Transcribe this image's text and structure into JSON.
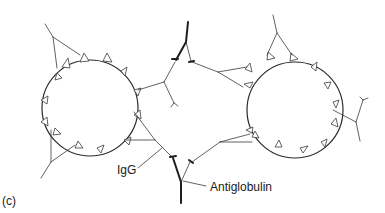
{
  "figure": {
    "panel_label": "(c)",
    "labels": {
      "igg": "IgG",
      "antiglobulin": "Antiglobulin"
    },
    "colors": {
      "line": "#3a3a3a",
      "background": "#ffffff",
      "text": "#1a1a1a"
    },
    "elements": {
      "cells": 2,
      "antiglobulin_molecules": 2
    }
  }
}
